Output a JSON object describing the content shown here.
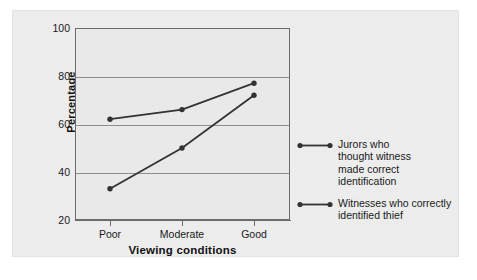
{
  "chart_data": {
    "type": "line",
    "title": "",
    "xlabel": "Viewing conditions",
    "ylabel": "Percentage",
    "categories": [
      "Poor",
      "Moderate",
      "Good"
    ],
    "xticklabels": [
      "Poor",
      "Moderate",
      "Good"
    ],
    "yticklabels": [
      "20",
      "40",
      "60",
      "80",
      "100"
    ],
    "yticks": [
      20,
      40,
      60,
      80,
      100
    ],
    "ylim": [
      20,
      100
    ],
    "grid": true,
    "legend_position": "right",
    "series": [
      {
        "name": "Jurors who\nthought witness\nmade correct\nidentification",
        "legend_label": "Jurors who\nthought witness\nmade correct\nidentification",
        "values": [
          62,
          66,
          77
        ],
        "color": "#333333",
        "marker": "circle"
      },
      {
        "name": "Witnesses who correctly\nidentified thief",
        "legend_label": "Witnesses who correctly\nidentified thief",
        "values": [
          33,
          50,
          72
        ],
        "color": "#333333",
        "marker": "circle"
      }
    ]
  },
  "colors": {
    "panel_background": "#eeeeee",
    "plot_background": "#e9e9e9",
    "axis": "#6b6b6b",
    "gridline": "#8f8f8f",
    "series_line": "#333333",
    "text": "#1a1a1a"
  },
  "axis": {
    "y_tick_0": "20",
    "y_tick_1": "40",
    "y_tick_2": "60",
    "y_tick_3": "80",
    "y_tick_4": "100",
    "x_tick_0": "Poor",
    "x_tick_1": "Moderate",
    "x_tick_2": "Good",
    "y_title": "Percentage",
    "x_title": "Viewing conditions"
  },
  "legend": {
    "entries": [
      {
        "label": "Jurors who\nthought witness\nmade correct\nidentification"
      },
      {
        "label": "Witnesses who correctly\nidentified thief"
      }
    ]
  }
}
